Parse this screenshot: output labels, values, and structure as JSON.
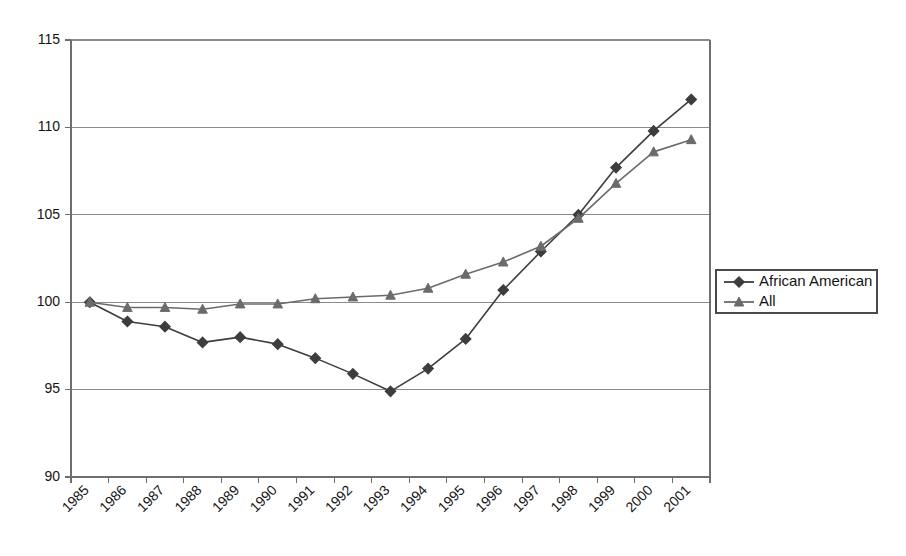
{
  "chart_data": {
    "type": "line",
    "title": "",
    "subtitle": "",
    "xlabel": "",
    "ylabel": "",
    "categories": [
      "1985",
      "1986",
      "1987",
      "1988",
      "1989",
      "1990",
      "1991",
      "1992",
      "1993",
      "1994",
      "1995",
      "1996",
      "1997",
      "1998",
      "1999",
      "2000",
      "2001"
    ],
    "ylim": [
      90,
      115
    ],
    "yticks": [
      90,
      95,
      100,
      105,
      110,
      115
    ],
    "grid": true,
    "legend_position": "right",
    "series": [
      {
        "name": "African American",
        "marker": "diamond",
        "color": "#3d3d3d",
        "values": [
          100.0,
          98.9,
          98.6,
          97.7,
          98.0,
          97.6,
          96.8,
          95.9,
          94.9,
          96.2,
          97.9,
          100.7,
          102.9,
          105.0,
          107.7,
          109.8,
          111.6
        ]
      },
      {
        "name": "All",
        "marker": "triangle",
        "color": "#6b6b6b",
        "values": [
          100.0,
          99.7,
          99.7,
          99.6,
          99.9,
          99.9,
          100.2,
          100.3,
          100.4,
          100.8,
          101.6,
          102.3,
          103.2,
          104.8,
          106.8,
          108.6,
          109.3
        ]
      }
    ]
  },
  "legend": {
    "entries": [
      {
        "label": "African American"
      },
      {
        "label": "All"
      }
    ]
  },
  "axes": {
    "y_tick_labels": [
      "115",
      "110",
      "105",
      "100",
      "95",
      "90"
    ],
    "x_tick_labels": [
      "1985",
      "1986",
      "1987",
      "1988",
      "1989",
      "1990",
      "1991",
      "1992",
      "1993",
      "1994",
      "1995",
      "1996",
      "1997",
      "1998",
      "1999",
      "2000",
      "2001"
    ]
  }
}
